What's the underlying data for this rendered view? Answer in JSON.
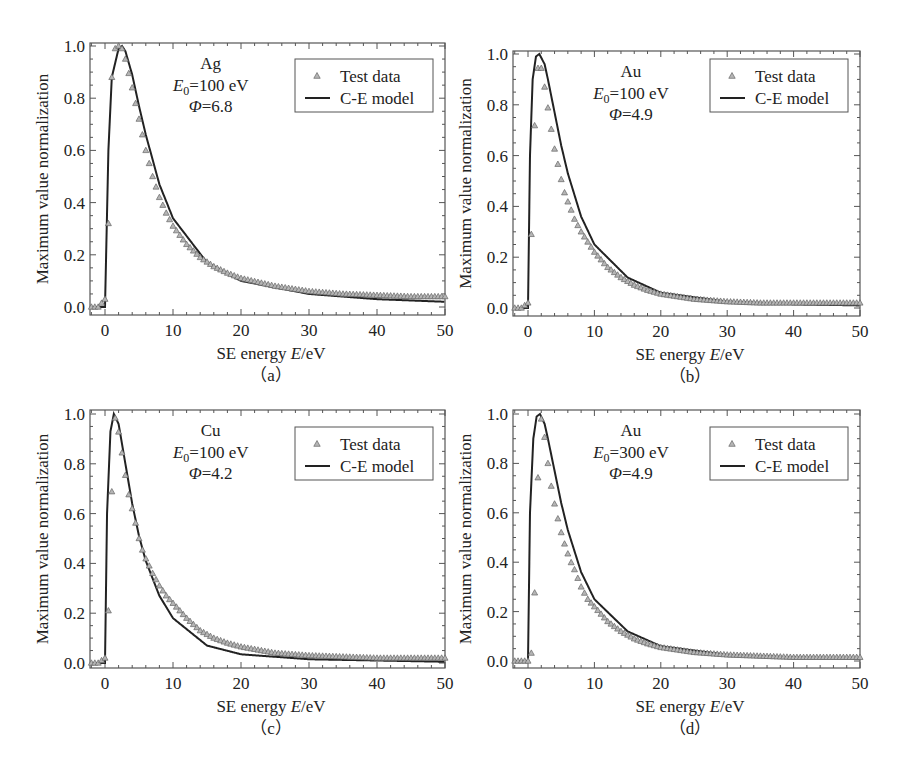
{
  "figure": {
    "panels": [
      {
        "id": "a",
        "caption": "（a）",
        "material": "Ag",
        "e0_label": "E",
        "e0_sub": "0",
        "e0_value": "=100 eV",
        "phi_symbol": "Φ",
        "phi_value": "=6.8",
        "legend": {
          "test": "Test data",
          "model": "C-E model"
        },
        "xlabel_pre": "SE energy ",
        "xlabel_var": "E",
        "xlabel_post": "/eV",
        "ylabel": "Maximum value normalization",
        "frame": {
          "left": 90,
          "right": 445,
          "top": 43,
          "bottom": 315
        },
        "x0px": 105,
        "x50px": 445,
        "y1px": 46,
        "y0px": 307,
        "legend_box": {
          "x": 295,
          "y": 59,
          "w": 138,
          "h": 53
        }
      },
      {
        "id": "b",
        "caption": "（b）",
        "material": "Au",
        "e0_label": "E",
        "e0_sub": "0",
        "e0_value": "=100 eV",
        "phi_symbol": "Φ",
        "phi_value": "=4.9",
        "legend": {
          "test": "Test data",
          "model": "C-E model"
        },
        "xlabel_pre": "SE energy ",
        "xlabel_var": "E",
        "xlabel_post": "/eV",
        "ylabel": "Maximum value normalization",
        "frame": {
          "left": 513,
          "right": 860,
          "top": 51,
          "bottom": 316
        },
        "x0px": 528,
        "x50px": 860,
        "y1px": 54,
        "y0px": 308,
        "legend_box": {
          "x": 710,
          "y": 59,
          "w": 138,
          "h": 53
        }
      },
      {
        "id": "c",
        "caption": "（c）",
        "material": "Cu",
        "e0_label": "E",
        "e0_sub": "0",
        "e0_value": "=100 eV",
        "phi_symbol": "Φ",
        "phi_value": "=4.2",
        "legend": {
          "test": "Test data",
          "model": "C-E model"
        },
        "xlabel_pre": "SE energy ",
        "xlabel_var": "E",
        "xlabel_post": "/eV",
        "ylabel": "Maximum value normalization",
        "frame": {
          "left": 90,
          "right": 445,
          "top": 410,
          "bottom": 668
        },
        "x0px": 105,
        "x50px": 445,
        "y1px": 414,
        "y0px": 663,
        "legend_box": {
          "x": 295,
          "y": 427,
          "w": 138,
          "h": 53
        }
      },
      {
        "id": "d",
        "caption": "（d）",
        "material": "Au",
        "e0_label": "E",
        "e0_sub": "0",
        "e0_value": "=300 eV",
        "phi_symbol": "Φ",
        "phi_value": "=4.9",
        "legend": {
          "test": "Test data",
          "model": "C-E model"
        },
        "xlabel_pre": "SE energy ",
        "xlabel_var": "E",
        "xlabel_post": "/eV",
        "ylabel": "Maximum value normalization",
        "frame": {
          "left": 513,
          "right": 860,
          "top": 410,
          "bottom": 668
        },
        "x0px": 528,
        "x50px": 860,
        "y1px": 414,
        "y0px": 661,
        "legend_box": {
          "x": 710,
          "y": 427,
          "w": 138,
          "h": 53
        }
      }
    ]
  },
  "chart_data": [
    {
      "type": "scatter+line",
      "title": "(a) Ag, E0=100 eV, Φ=6.8",
      "xlabel": "SE energy E/eV",
      "ylabel": "Maximum value normalization",
      "xlim": [
        -2,
        50
      ],
      "ylim": [
        0,
        1.0
      ],
      "xticks": [
        0,
        10,
        20,
        30,
        40,
        50
      ],
      "yticks": [
        0.0,
        0.2,
        0.4,
        0.6,
        0.8,
        1.0
      ],
      "legend": [
        "Test data",
        "C-E model"
      ],
      "legend_position": "upper right",
      "series": [
        {
          "name": "Test data",
          "marker": "triangle",
          "x": [
            -2,
            -1,
            0,
            0.5,
            1,
            1.5,
            2,
            2.5,
            3,
            4,
            5,
            6,
            7,
            8,
            9,
            10,
            12,
            14,
            16,
            18,
            20,
            25,
            30,
            35,
            40,
            45,
            50
          ],
          "y": [
            0.0,
            0.0,
            0.03,
            0.32,
            0.88,
            0.99,
            1.0,
            0.99,
            0.95,
            0.84,
            0.72,
            0.6,
            0.5,
            0.42,
            0.36,
            0.31,
            0.24,
            0.19,
            0.155,
            0.13,
            0.11,
            0.08,
            0.06,
            0.05,
            0.045,
            0.04,
            0.04
          ]
        },
        {
          "name": "C-E model",
          "line": "solid",
          "x": [
            0,
            0.5,
            1,
            2,
            2.5,
            3,
            4,
            5,
            6,
            8,
            10,
            15,
            20,
            30,
            40,
            50
          ],
          "y": [
            0.0,
            0.6,
            0.88,
            0.99,
            1.0,
            0.98,
            0.89,
            0.77,
            0.66,
            0.47,
            0.34,
            0.17,
            0.1,
            0.05,
            0.03,
            0.02
          ]
        }
      ]
    },
    {
      "type": "scatter+line",
      "title": "(b) Au, E0=100 eV, Φ=4.9",
      "xlabel": "SE energy E/eV",
      "ylabel": "Maximum value normalization",
      "xlim": [
        -2,
        50
      ],
      "ylim": [
        0,
        1.0
      ],
      "xticks": [
        0,
        10,
        20,
        30,
        40,
        50
      ],
      "yticks": [
        0.0,
        0.2,
        0.4,
        0.6,
        0.8,
        1.0
      ],
      "legend": [
        "Test data",
        "C-E model"
      ],
      "legend_position": "upper right",
      "series": [
        {
          "name": "Test data",
          "marker": "triangle",
          "x": [
            -2,
            -1,
            0,
            0.3,
            0.7,
            1.2,
            1.7,
            2.2,
            2.8,
            3.3,
            3.8,
            4.3,
            4.8,
            5.3,
            5.8,
            6.3,
            7,
            8,
            9,
            10,
            12,
            14,
            16,
            18,
            20,
            25,
            30,
            35,
            40,
            45,
            50
          ],
          "y": [
            0.0,
            0.0,
            0.02,
            0.12,
            0.46,
            0.89,
            0.98,
            0.92,
            0.82,
            0.74,
            0.65,
            0.59,
            0.53,
            0.47,
            0.43,
            0.4,
            0.35,
            0.3,
            0.26,
            0.22,
            0.16,
            0.12,
            0.09,
            0.07,
            0.055,
            0.035,
            0.025,
            0.02,
            0.02,
            0.02,
            0.02
          ]
        },
        {
          "name": "C-E model",
          "line": "solid",
          "x": [
            0,
            0.3,
            0.7,
            1.2,
            1.7,
            2.5,
            3,
            4,
            5,
            6,
            8,
            10,
            15,
            20,
            30,
            40,
            50
          ],
          "y": [
            0.0,
            0.6,
            0.9,
            0.99,
            1.0,
            0.96,
            0.9,
            0.77,
            0.64,
            0.53,
            0.36,
            0.25,
            0.12,
            0.06,
            0.025,
            0.015,
            0.01
          ]
        }
      ]
    },
    {
      "type": "scatter+line",
      "title": "(c) Cu, E0=100 eV, Φ=4.2",
      "xlabel": "SE energy E/eV",
      "ylabel": "Maximum value normalization",
      "xlim": [
        -2,
        50
      ],
      "ylim": [
        0,
        1.0
      ],
      "xticks": [
        0,
        10,
        20,
        30,
        40,
        50
      ],
      "yticks": [
        0.0,
        0.2,
        0.4,
        0.6,
        0.8,
        1.0
      ],
      "legend": [
        "Test data",
        "C-E model"
      ],
      "legend_position": "upper right",
      "series": [
        {
          "name": "Test data",
          "marker": "triangle",
          "x": [
            -2,
            -1,
            0,
            0.3,
            0.8,
            1.3,
            1.8,
            2.3,
            2.8,
            3.3,
            3.8,
            4.3,
            4.8,
            5.3,
            5.8,
            6.5,
            7,
            8,
            9,
            10,
            12,
            14,
            16,
            18,
            20,
            25,
            30,
            35,
            40,
            45,
            50
          ],
          "y": [
            0.0,
            0.0,
            0.02,
            0.03,
            0.48,
            1.0,
            0.96,
            0.88,
            0.79,
            0.7,
            0.64,
            0.59,
            0.52,
            0.47,
            0.43,
            0.39,
            0.36,
            0.31,
            0.27,
            0.24,
            0.18,
            0.13,
            0.1,
            0.08,
            0.065,
            0.04,
            0.03,
            0.025,
            0.02,
            0.02,
            0.02
          ]
        },
        {
          "name": "C-E model",
          "line": "solid",
          "x": [
            0,
            0.3,
            0.8,
            1.3,
            2,
            3,
            4,
            5,
            6,
            8,
            10,
            15,
            20,
            30,
            40,
            50
          ],
          "y": [
            0.0,
            0.6,
            0.93,
            1.0,
            0.96,
            0.8,
            0.64,
            0.51,
            0.41,
            0.27,
            0.18,
            0.07,
            0.035,
            0.015,
            0.01,
            0.005
          ]
        }
      ]
    },
    {
      "type": "scatter+line",
      "title": "(d) Au, E0=300 eV, Φ=4.9",
      "xlabel": "SE energy E/eV",
      "ylabel": "Maximum value normalization",
      "xlim": [
        -2,
        50
      ],
      "ylim": [
        0,
        1.0
      ],
      "xticks": [
        0,
        10,
        20,
        30,
        40,
        50
      ],
      "yticks": [
        0.0,
        0.2,
        0.4,
        0.6,
        0.8,
        1.0
      ],
      "legend": [
        "Test data",
        "C-E model"
      ],
      "legend_position": "upper right",
      "series": [
        {
          "name": "Test data",
          "marker": "triangle",
          "x": [
            -2,
            -1,
            0,
            0.3,
            0.8,
            1.3,
            1.8,
            2.3,
            2.8,
            3.3,
            3.8,
            4.3,
            4.8,
            5.3,
            5.8,
            6.3,
            7,
            8,
            9,
            10,
            12,
            14,
            16,
            18,
            20,
            25,
            30,
            35,
            40,
            45,
            50
          ],
          "y": [
            0.0,
            0.0,
            0.0,
            0.0,
            0.08,
            0.57,
            1.0,
            0.95,
            0.84,
            0.74,
            0.66,
            0.6,
            0.54,
            0.49,
            0.45,
            0.41,
            0.37,
            0.3,
            0.25,
            0.22,
            0.16,
            0.12,
            0.09,
            0.07,
            0.055,
            0.035,
            0.025,
            0.02,
            0.015,
            0.015,
            0.015
          ]
        },
        {
          "name": "C-E model",
          "line": "solid",
          "x": [
            0,
            0.3,
            0.8,
            1.3,
            1.8,
            2.5,
            3,
            4,
            5,
            6,
            8,
            10,
            15,
            20,
            30,
            40,
            50
          ],
          "y": [
            0.0,
            0.6,
            0.9,
            0.99,
            1.0,
            0.96,
            0.9,
            0.77,
            0.64,
            0.53,
            0.36,
            0.25,
            0.12,
            0.06,
            0.025,
            0.015,
            0.01
          ]
        }
      ]
    }
  ]
}
